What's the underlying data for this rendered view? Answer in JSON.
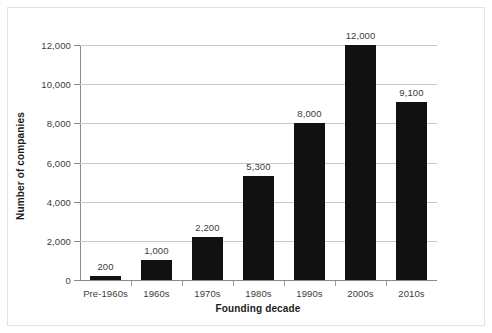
{
  "chart_data": {
    "type": "bar",
    "title": "",
    "subtitle": "",
    "xlabel": "Founding decade",
    "ylabel": "Number of companies",
    "categories": [
      "Pre-1960s",
      "1960s",
      "1970s",
      "1980s",
      "1990s",
      "2000s",
      "2010s"
    ],
    "values": [
      200,
      1000,
      2200,
      5300,
      8000,
      12000,
      9100
    ],
    "value_labels": [
      "200",
      "1,000",
      "2,200",
      "5,300",
      "8,000",
      "12,000",
      "9,100"
    ],
    "ylim": [
      0,
      12000
    ],
    "ytick_values": [
      0,
      2000,
      4000,
      6000,
      8000,
      10000,
      12000
    ],
    "ytick_labels": [
      "0",
      "2,000",
      "4,000",
      "6,000",
      "8,000",
      "10,000",
      "12,000"
    ],
    "grid": "horizontal",
    "legend": "none",
    "series": [
      {
        "name": "Number of companies",
        "values": [
          200,
          1000,
          2200,
          5300,
          8000,
          12000,
          9100
        ]
      }
    ],
    "colors": {
      "bar": "#111111",
      "gridline": "#c8c8c8",
      "axis": "#8a8a8a",
      "tick_text": "#3b3b3b",
      "axis_title": "#1b1b1b",
      "background": "#ffffff",
      "frame_border": "#e3e3e3"
    }
  }
}
